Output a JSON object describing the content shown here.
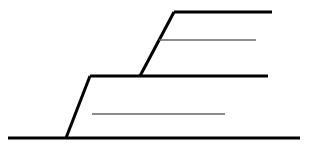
{
  "canvas": {
    "width": 311,
    "height": 157,
    "background_color": "#ffffff"
  },
  "figure": {
    "type": "line-diagram",
    "stroke_colors": {
      "primary": "#000000",
      "secondary": "#666666"
    },
    "stroke_widths": {
      "primary": 3,
      "secondary": 1.5
    }
  },
  "chart_data": {
    "type": "line",
    "title": "",
    "subtitle": "",
    "xlabel": "",
    "ylabel": "",
    "grid": false,
    "legend": "none",
    "xlim": [
      0,
      311
    ],
    "ylim": [
      157,
      0
    ],
    "series": [
      {
        "name": "baseline",
        "style": "thick",
        "color": "#000000",
        "width": 3,
        "points": [
          [
            8,
            138
          ],
          [
            300,
            138
          ]
        ]
      },
      {
        "name": "lower-riser",
        "style": "thick",
        "color": "#000000",
        "width": 3,
        "points": [
          [
            66,
            138
          ],
          [
            90,
            76
          ]
        ]
      },
      {
        "name": "middle-tread",
        "style": "thick",
        "color": "#000000",
        "width": 3,
        "points": [
          [
            90,
            76
          ],
          [
            268,
            76
          ]
        ]
      },
      {
        "name": "upper-riser",
        "style": "thick",
        "color": "#000000",
        "width": 3,
        "points": [
          [
            140,
            76
          ],
          [
            174,
            12
          ]
        ]
      },
      {
        "name": "top-tread",
        "style": "thick",
        "color": "#000000",
        "width": 3,
        "points": [
          [
            174,
            12
          ],
          [
            272,
            12
          ]
        ]
      },
      {
        "name": "lower-reference-line",
        "style": "thin",
        "color": "#666666",
        "width": 1.5,
        "points": [
          [
            92,
            114
          ],
          [
            225,
            114
          ]
        ]
      },
      {
        "name": "upper-reference-line",
        "style": "thin",
        "color": "#666666",
        "width": 1.5,
        "points": [
          [
            159,
            40
          ],
          [
            256,
            40
          ]
        ]
      }
    ]
  }
}
